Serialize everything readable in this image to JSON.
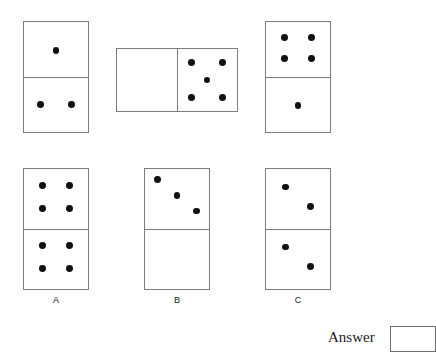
{
  "puzzle": {
    "type": "domino-sequence",
    "pip_color": "#111111",
    "tile_border_color": "#7d7d7d",
    "background": "#ffffff",
    "sequence": {
      "name": "question-sequence",
      "tiles": [
        {
          "id": "sequence-tile-1",
          "orientation": "vertical",
          "x": 23,
          "y": 21,
          "width": 66,
          "height": 112,
          "halves": [
            {
              "position": "top",
              "value": 1,
              "pattern": "one-offset"
            },
            {
              "position": "bottom",
              "value": 2,
              "pattern": "two-horizontal"
            }
          ]
        },
        {
          "id": "sequence-tile-2",
          "orientation": "horizontal",
          "x": 116,
          "y": 48,
          "width": 122,
          "height": 64,
          "halves": [
            {
              "position": "left",
              "value": 0,
              "pattern": "blank"
            },
            {
              "position": "right",
              "value": 5,
              "pattern": "quincunx"
            }
          ]
        },
        {
          "id": "sequence-tile-3",
          "orientation": "vertical",
          "x": 265,
          "y": 21,
          "width": 66,
          "height": 112,
          "halves": [
            {
              "position": "top",
              "value": 4,
              "pattern": "four-square"
            },
            {
              "position": "bottom",
              "value": 1,
              "pattern": "one-offset"
            }
          ]
        }
      ]
    },
    "options": {
      "name": "answer-options",
      "tiles": [
        {
          "id": "option-tile-a",
          "label": "A",
          "orientation": "vertical",
          "x": 23,
          "y": 168,
          "width": 66,
          "height": 122,
          "label_x": 23,
          "label_y": 295,
          "label_width": 66,
          "halves": [
            {
              "position": "top",
              "value": 4,
              "pattern": "four-square"
            },
            {
              "position": "bottom",
              "value": 4,
              "pattern": "four-square"
            }
          ]
        },
        {
          "id": "option-tile-b",
          "label": "B",
          "orientation": "vertical",
          "x": 144,
          "y": 168,
          "width": 66,
          "height": 122,
          "label_x": 144,
          "label_y": 295,
          "label_width": 66,
          "halves": [
            {
              "position": "top",
              "value": 3,
              "pattern": "three-diagonal"
            },
            {
              "position": "bottom",
              "value": 0,
              "pattern": "blank"
            }
          ]
        },
        {
          "id": "option-tile-c",
          "label": "C",
          "orientation": "vertical",
          "x": 265,
          "y": 168,
          "width": 66,
          "height": 122,
          "label_x": 265,
          "label_y": 295,
          "label_width": 66,
          "halves": [
            {
              "position": "top",
              "value": 2,
              "pattern": "two-diagonal"
            },
            {
              "position": "bottom",
              "value": 2,
              "pattern": "two-diagonal"
            }
          ]
        }
      ]
    }
  },
  "answer": {
    "label": "Answer",
    "value": ""
  }
}
